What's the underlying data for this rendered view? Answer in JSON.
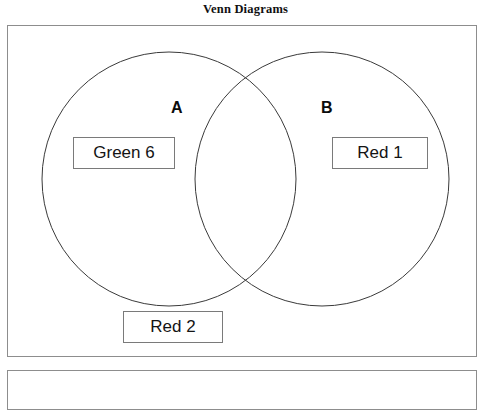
{
  "document": {
    "title": "Venn Diagrams"
  },
  "diagram": {
    "type": "venn-two-set",
    "sets": [
      {
        "id": "A",
        "label": "A",
        "circle": {
          "cx": 161,
          "cy": 153,
          "r": 127
        }
      },
      {
        "id": "B",
        "label": "B",
        "circle": {
          "cx": 314,
          "cy": 153,
          "r": 127
        }
      }
    ],
    "items": [
      {
        "id": "green-6",
        "label": "Green 6",
        "region": "A-only"
      },
      {
        "id": "red-1",
        "label": "Red 1",
        "region": "B-only"
      },
      {
        "id": "red-2",
        "label": "Red 2",
        "region": "outside"
      }
    ],
    "colors": {
      "circle_stroke": "#3a3a3a",
      "box_border": "#8d8d8d",
      "item_border": "#7a7a7a",
      "text": "#141414",
      "background": "#ffffff"
    }
  }
}
